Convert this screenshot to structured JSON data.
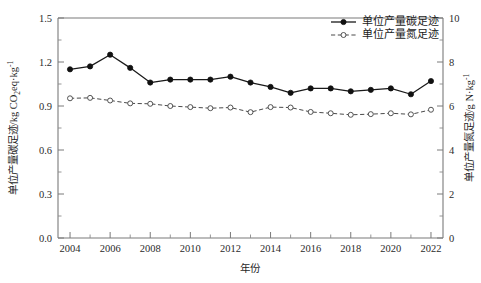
{
  "chart_data": {
    "type": "line",
    "title": "",
    "xlabel": "年份",
    "ylabel": "单位产量碳足迹/kg CO2eq·kg-1",
    "ylabel_right": "单位产量氮足迹/g N·kg-1",
    "x": [
      2004,
      2005,
      2006,
      2007,
      2008,
      2009,
      2010,
      2011,
      2012,
      2013,
      2014,
      2015,
      2016,
      2017,
      2018,
      2019,
      2020,
      2021,
      2022
    ],
    "xlim": [
      2003.4,
      2022.6
    ],
    "xticks": [
      2004,
      2006,
      2008,
      2010,
      2012,
      2014,
      2016,
      2018,
      2020,
      2022
    ],
    "xtick_labels": [
      "2004",
      "2006",
      "2008",
      "2010",
      "2012",
      "2014",
      "2016",
      "2018",
      "2020",
      "2022"
    ],
    "ylim": [
      0.0,
      1.5
    ],
    "yticks": [
      0.0,
      0.3,
      0.6,
      0.9,
      1.2,
      1.5
    ],
    "ytick_labels": [
      "0.0",
      "0.3",
      "0.6",
      "0.9",
      "1.2",
      "1.5"
    ],
    "ylim_right": [
      0,
      10
    ],
    "yticks_right": [
      0,
      2,
      4,
      6,
      8,
      10
    ],
    "ytick_labels_right": [
      "0",
      "2",
      "4",
      "6",
      "8",
      "10"
    ],
    "grid": false,
    "legend_position": "top-right",
    "series": [
      {
        "name": "单位产量碳足迹",
        "axis": "left",
        "marker": "filled-circle",
        "linestyle": "solid",
        "color": "#111111",
        "values": [
          1.15,
          1.17,
          1.25,
          1.16,
          1.06,
          1.08,
          1.08,
          1.08,
          1.1,
          1.06,
          1.03,
          0.99,
          1.02,
          1.02,
          1.0,
          1.01,
          1.02,
          0.98,
          1.07
        ]
      },
      {
        "name": "单位产量氮足迹",
        "axis": "right",
        "marker": "open-circle",
        "linestyle": "dashed",
        "color": "#4a4a4a",
        "values": [
          6.35,
          6.37,
          6.25,
          6.12,
          6.1,
          6.0,
          5.95,
          5.9,
          5.93,
          5.72,
          5.95,
          5.93,
          5.73,
          5.67,
          5.6,
          5.63,
          5.67,
          5.62,
          5.83
        ]
      }
    ]
  },
  "axes": {
    "x_title": "年份",
    "y_left": {
      "prefix": "单位产量碳足迹/kg CO",
      "sub": "2",
      "mid": "eq·kg",
      "sup": "-1"
    },
    "y_right": {
      "prefix": "单位产量氮足迹/g N·kg",
      "sup": "-1"
    }
  },
  "legend": {
    "items": [
      {
        "label": "单位产量碳足迹",
        "style": "solid-filled"
      },
      {
        "label": "单位产量氮足迹",
        "style": "dashed-open"
      }
    ]
  },
  "colors": {
    "carbon": "#111111",
    "nitrogen": "#4a4a4a",
    "axis": "#7a7a7a",
    "background": "#ffffff"
  }
}
